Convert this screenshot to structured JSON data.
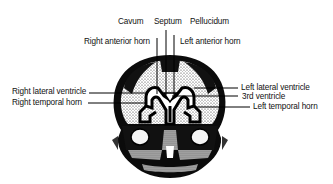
{
  "diagram": {
    "labels": {
      "cavum": "Cavum",
      "septum": "Septum",
      "pellucidum": "Pellucidum",
      "right_anterior_horn": "Right anterior horn",
      "left_anterior_horn": "Left anterior horn",
      "right_lateral_ventricle": "Right lateral ventricle",
      "right_temporal_horn": "Right temporal horn",
      "left_lateral_ventricle": "Left lateral ventricle",
      "third_ventricle": "3rd ventricle",
      "left_temporal_horn": "Left temporal horn"
    }
  }
}
